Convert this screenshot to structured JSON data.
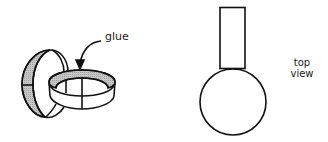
{
  "diagram": {
    "left_figure": {
      "description": "two interlocking rings joined with glue",
      "annotation": "glue"
    },
    "right_figure": {
      "description": "rectangle atop a circle",
      "annotation_line1": "top",
      "annotation_line2": "view"
    },
    "colors": {
      "stroke": "#111111",
      "shade": "#b8b8b8",
      "background": "#ffffff"
    }
  }
}
